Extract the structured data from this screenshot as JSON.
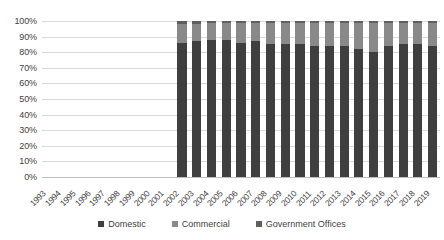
{
  "chart_data": {
    "type": "bar",
    "stacked": true,
    "stack_mode": "percent",
    "title": "",
    "subtitle": "",
    "xlabel": "",
    "ylabel": "",
    "grid": true,
    "legend_position": "bottom",
    "ylim": [
      0,
      100
    ],
    "ytick_labels": [
      "100%",
      "90%",
      "80%",
      "70%",
      "60%",
      "50%",
      "40%",
      "30%",
      "20%",
      "10%",
      "0%"
    ],
    "ytick_values": [
      100,
      90,
      80,
      70,
      60,
      50,
      40,
      30,
      20,
      10,
      0
    ],
    "categories": [
      "1993",
      "1994",
      "1995",
      "1996",
      "1997",
      "1998",
      "1999",
      "2000",
      "2001",
      "2002",
      "2003",
      "2004",
      "2005",
      "2006",
      "2007",
      "2008",
      "2009",
      "2010",
      "2011",
      "2012",
      "2013",
      "2014",
      "2015",
      "2016",
      "2017",
      "2018",
      "2019"
    ],
    "series": [
      {
        "name": "Domestic",
        "color": "#3f3f3f",
        "values": [
          null,
          null,
          null,
          null,
          null,
          null,
          null,
          null,
          null,
          86,
          87,
          88,
          88,
          86,
          87,
          85,
          85,
          85,
          84,
          84,
          84,
          82,
          80,
          84,
          85,
          85,
          84
        ]
      },
      {
        "name": "Commercial",
        "color": "#898989",
        "values": [
          null,
          null,
          null,
          null,
          null,
          null,
          null,
          null,
          null,
          12,
          11,
          11,
          11,
          13,
          12,
          14,
          14,
          14,
          15,
          15,
          15,
          17,
          19,
          15,
          14,
          14,
          15
        ]
      },
      {
        "name": "Government Offices",
        "color": "#5f5f5f",
        "values": [
          null,
          null,
          null,
          null,
          null,
          null,
          null,
          null,
          null,
          2,
          2,
          1,
          1,
          1,
          1,
          1,
          1,
          1,
          1,
          1,
          1,
          1,
          1,
          1,
          1,
          1,
          1
        ]
      }
    ]
  },
  "legend": {
    "items": [
      {
        "label": "Domestic",
        "color": "#3f3f3f"
      },
      {
        "label": "Commercial",
        "color": "#898989"
      },
      {
        "label": "Government Offices",
        "color": "#5f5f5f"
      }
    ]
  }
}
